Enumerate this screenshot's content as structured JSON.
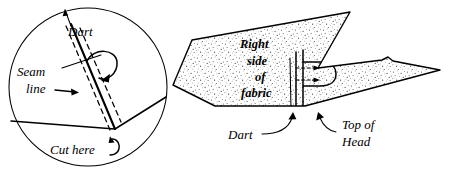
{
  "figure": {
    "type": "line-drawing",
    "panels": [
      {
        "id": "detail-circle",
        "name": "circular detail view",
        "labels": [
          "Dart",
          "Seam line",
          "Cut here"
        ]
      },
      {
        "id": "fabric-piece",
        "name": "fabric piece with dart",
        "labels": [
          "Right side of fabric",
          "Dart",
          "Top of Head"
        ]
      }
    ]
  },
  "circle_panel": {
    "dart_label": "Dart",
    "seam_label_line1": "Seam",
    "seam_label_line2": "line",
    "cut_label": "Cut here"
  },
  "fabric_panel": {
    "fabric_label_line1": "Right",
    "fabric_label_line2": "side",
    "fabric_label_line3": "of",
    "fabric_label_line4": "fabric",
    "dart_label": "Dart",
    "head_label_line1": "Top of",
    "head_label_line2": "Head"
  },
  "colors": {
    "ink": "#000000",
    "paper": "#ffffff",
    "stipple": "#4a4a4a"
  }
}
